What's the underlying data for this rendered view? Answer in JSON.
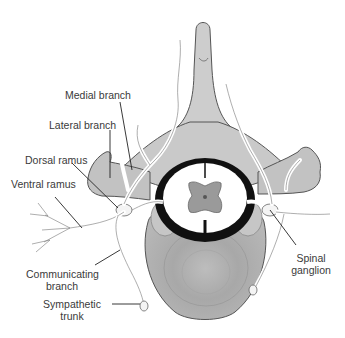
{
  "diagram": {
    "labels": {
      "medial_branch": "Medial branch",
      "lateral_branch": "Lateral branch",
      "dorsal_ramus": "Dorsal ramus",
      "ventral_ramus": "Ventral ramus",
      "communicating_branch_1": "Communicating",
      "communicating_branch_2": "branch",
      "sympathetic_trunk_1": "Sympathetic",
      "sympathetic_trunk_2": "trunk",
      "spinal_ganglion_1": "Spinal",
      "spinal_ganglion_2": "ganglion"
    },
    "colors": {
      "bone": "#cfcfcf",
      "bone_dark": "#a9a9a9",
      "outline": "#555555",
      "dura": "#111111",
      "cord_white": "#ffffff",
      "grey_matter": "#9a9a9a",
      "nerve_fill": "#f2f2f2",
      "text": "#3a3a3a"
    }
  }
}
